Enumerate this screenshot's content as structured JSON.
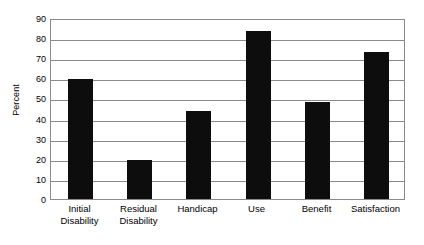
{
  "chart_data": {
    "type": "bar",
    "title": "",
    "subtitle": "",
    "xlabel": "",
    "ylabel": "Percent",
    "categories": [
      "Initial Disability",
      "Residual Disability",
      "Handicap",
      "Use",
      "Benefit",
      "Satisfaction"
    ],
    "category_lines": [
      [
        "Initial",
        "Disability"
      ],
      [
        "Residual",
        "Disability"
      ],
      [
        "Handicap",
        ""
      ],
      [
        "Use",
        ""
      ],
      [
        "Benefit",
        ""
      ],
      [
        "Satisfaction",
        ""
      ]
    ],
    "values": [
      59.5,
      19.5,
      44,
      83.5,
      48,
      73
    ],
    "ylim": [
      0,
      90
    ],
    "ytick_labels": [
      "0",
      "10",
      "20",
      "30",
      "40",
      "50",
      "60",
      "70",
      "80",
      "90"
    ],
    "ytick_values": [
      0,
      10,
      20,
      30,
      40,
      50,
      60,
      70,
      80,
      90
    ],
    "grid": true,
    "legend": false,
    "legend_position": "none",
    "bar_color": "#0d0d0d",
    "grid_color": "#8a8a8a",
    "background_color": "#ffffff"
  }
}
